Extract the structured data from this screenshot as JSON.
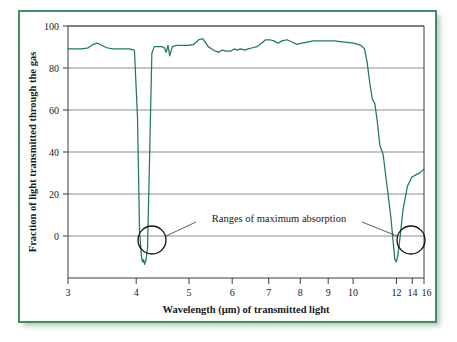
{
  "figure": {
    "frame_color": "#3f8f63",
    "background": "#ffffff"
  },
  "chart_data": {
    "type": "line",
    "title": "",
    "xlabel": "Wavelength (µm) of transmitted light",
    "ylabel": "Fraction of light transmitted through the gas",
    "xscale": "log",
    "xlim": [
      3,
      16
    ],
    "ylim": [
      -10,
      100
    ],
    "grid": true,
    "legend": null,
    "xticks": [
      3,
      4,
      5,
      6,
      7,
      8,
      9,
      10,
      12,
      14,
      16
    ],
    "xticklabels": [
      "3",
      "4",
      "5",
      "6",
      "7",
      "8",
      "9",
      "10",
      "12",
      "14",
      "16"
    ],
    "yticks": [
      0,
      20,
      40,
      60,
      80,
      100
    ],
    "yticklabels": [
      "0",
      "20",
      "40",
      "60",
      "80",
      "100"
    ],
    "series": [
      {
        "name": "transmittance",
        "color": "#1f7a52",
        "x": [
          3.0,
          3.1,
          3.2,
          3.3,
          3.38,
          3.45,
          3.52,
          3.6,
          3.7,
          3.85,
          4.0,
          4.1,
          4.16,
          4.2,
          4.24,
          4.26,
          4.28,
          4.3,
          4.33,
          4.36,
          4.4,
          4.45,
          4.5,
          4.58,
          4.66,
          4.72,
          4.76,
          4.8,
          4.84,
          4.9,
          5.0,
          5.1,
          5.2,
          5.3,
          5.42,
          5.55,
          5.65,
          5.72,
          5.8,
          5.9,
          6.0,
          6.1,
          6.2,
          6.3,
          6.45,
          6.55,
          6.65,
          6.75,
          6.9,
          7.0,
          7.15,
          7.3,
          7.45,
          7.6,
          7.75,
          7.9,
          8.05,
          8.2,
          8.4,
          8.6,
          8.8,
          9.0,
          9.25,
          9.5,
          9.8,
          10.1,
          10.5,
          11.0,
          11.5,
          11.9,
          12.1,
          12.25,
          12.4,
          12.55,
          12.7,
          12.85,
          13.0,
          13.2,
          13.45,
          13.7,
          13.85,
          13.95,
          14.05,
          14.15,
          14.3,
          14.5,
          14.8,
          15.1,
          15.4,
          15.7,
          16.0
        ],
        "y": [
          90,
          90,
          90,
          90.5,
          92,
          92.5,
          91.5,
          90.5,
          90,
          90,
          90,
          89.5,
          60,
          10,
          -1,
          -3,
          -2,
          -4,
          -2,
          3,
          40,
          88,
          91,
          91,
          91,
          90.5,
          88.5,
          91.5,
          87,
          91,
          91.5,
          91.5,
          91.5,
          91.5,
          92,
          94,
          94.5,
          93,
          91,
          90,
          89,
          88.5,
          89.5,
          89,
          89,
          90,
          89.5,
          90,
          89.5,
          90,
          90.5,
          91,
          92.5,
          94,
          94,
          93.5,
          92.5,
          93.5,
          94,
          93,
          92,
          92.5,
          93,
          93.5,
          93.5,
          93.5,
          93.5,
          93,
          92.5,
          91.5,
          90,
          84,
          75,
          68,
          66,
          58,
          48,
          44,
          30,
          16,
          5,
          -2,
          -3,
          0,
          8,
          20,
          30,
          34,
          35,
          36,
          37.5
        ]
      }
    ],
    "annotations": [
      {
        "name": "ranges-of-maximum-absorption",
        "text": "Ranges of maximum absorption",
        "targets": [
          "left-absorption-band",
          "right-absorption-band"
        ]
      }
    ],
    "callouts": [
      {
        "name": "left-absorption-band",
        "center_x": 4.26,
        "center_y": 0,
        "radius_note": "circle"
      },
      {
        "name": "right-absorption-band",
        "center_x": 14.05,
        "center_y": 0,
        "radius_note": "circle"
      }
    ]
  }
}
